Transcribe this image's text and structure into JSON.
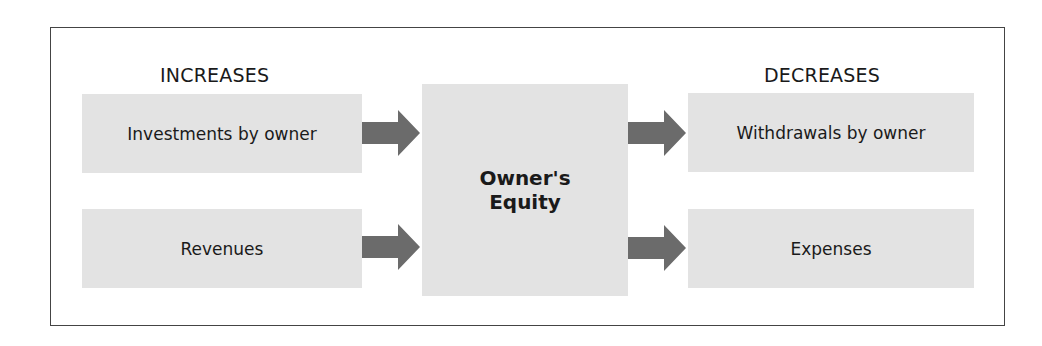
{
  "diagram": {
    "increases_heading": "INCREASES",
    "decreases_heading": "DECREASES",
    "center": {
      "line1": "Owner's",
      "line2": "Equity"
    },
    "increases": [
      {
        "label": "Investments by owner"
      },
      {
        "label": "Revenues"
      }
    ],
    "decreases": [
      {
        "label": "Withdrawals by owner"
      },
      {
        "label": "Expenses"
      }
    ],
    "colors": {
      "box_fill": "#e3e3e3",
      "arrow_fill": "#6b6b6b",
      "frame_border": "#444444"
    }
  }
}
